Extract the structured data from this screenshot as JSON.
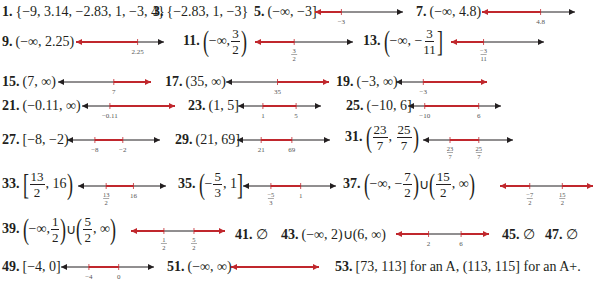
{
  "colors": {
    "solution": "#c0272d",
    "axis": "#231f20",
    "label": "#555555"
  },
  "answers": [
    {
      "number": "1.",
      "text": "{−9, 3.14, −2.83, 1, −3, 4}"
    },
    {
      "number": "3.",
      "text": "{−2.83, 1, −3}"
    },
    {
      "number": "5.",
      "text": "(−∞, −3]",
      "line": {
        "ticks": [
          "−3"
        ]
      }
    },
    {
      "number": "7.",
      "text": "(−∞, 4.8)",
      "line": {
        "ticks": [
          "4.8"
        ]
      }
    },
    {
      "number": "9.",
      "text": "(−∞, 2.25)",
      "line": {
        "ticks": [
          "2.25"
        ]
      }
    },
    {
      "number": "11.",
      "pre": "−∞,",
      "frac": [
        "3",
        "2"
      ],
      "line": {
        "ticks": [
          [
            "3",
            "2"
          ]
        ]
      }
    },
    {
      "number": "13.",
      "pre": "−∞, −",
      "frac": [
        "3",
        "11"
      ],
      "line": {
        "ticks": [
          [
            "−3",
            "11"
          ]
        ]
      }
    },
    {
      "number": "15.",
      "text": "(7, ∞)",
      "line": {
        "ticks": [
          "7"
        ]
      }
    },
    {
      "number": "17.",
      "text": "(35, ∞)",
      "line": {
        "ticks": [
          "35"
        ]
      }
    },
    {
      "number": "19.",
      "text": "(−3, ∞)",
      "line": {
        "ticks": [
          "−3"
        ]
      }
    },
    {
      "number": "21.",
      "text": "(−0.11, ∞)",
      "line": {
        "ticks": [
          "−0.11"
        ]
      }
    },
    {
      "number": "23.",
      "text": "(1, 5]",
      "line": {
        "ticks": [
          "1",
          "5"
        ]
      }
    },
    {
      "number": "25.",
      "text": "(−10, 6]",
      "line": {
        "ticks": [
          "−10",
          "6"
        ]
      }
    },
    {
      "number": "27.",
      "text": "[−8, −2)",
      "line": {
        "ticks": [
          "−8",
          "−2"
        ]
      }
    },
    {
      "number": "29.",
      "text": "(21, 69]",
      "line": {
        "ticks": [
          "21",
          "69"
        ]
      }
    },
    {
      "number": "31.",
      "frac1": [
        "23",
        "7"
      ],
      "frac2": [
        "25",
        "7"
      ],
      "line": {
        "ticks": [
          [
            "23",
            "7"
          ],
          [
            "25",
            "7"
          ]
        ]
      }
    },
    {
      "number": "33.",
      "frac1": [
        "13",
        "2"
      ],
      "post": "16",
      "line": {
        "ticks": [
          [
            "13",
            "2"
          ],
          "16"
        ]
      }
    },
    {
      "number": "35.",
      "pre": "−",
      "frac1": [
        "5",
        "3"
      ],
      "post": "1",
      "line": {
        "ticks": [
          [
            "−5",
            "3"
          ],
          "1"
        ]
      }
    },
    {
      "number": "37.",
      "pre": "−∞, −",
      "frac1": [
        "7",
        "2"
      ],
      "union": "∪",
      "frac2": [
        "15",
        "2"
      ],
      "post": "∞",
      "line": {
        "ticks": [
          [
            "−7",
            "2"
          ],
          [
            "15",
            "2"
          ]
        ]
      }
    },
    {
      "number": "39.",
      "pre": "−∞,",
      "frac1": [
        "1",
        "2"
      ],
      "union": "∪",
      "frac2": [
        "5",
        "2"
      ],
      "post": "∞",
      "line": {
        "ticks": [
          [
            "1",
            "2"
          ],
          [
            "5",
            "2"
          ]
        ]
      }
    },
    {
      "number": "41.",
      "text": "∅"
    },
    {
      "number": "43.",
      "text": "(−∞, 2)∪(6, ∞)",
      "line": {
        "ticks": [
          "2",
          "6"
        ]
      }
    },
    {
      "number": "45.",
      "text": "∅"
    },
    {
      "number": "47.",
      "text": "∅"
    },
    {
      "number": "49.",
      "text": "[−4, 0]",
      "line": {
        "ticks": [
          "−4",
          "0"
        ]
      }
    },
    {
      "number": "51.",
      "text": "(−∞, ∞)",
      "line": {
        "ticks": []
      }
    },
    {
      "number": "53.",
      "text": "[73, 113] for an A, (113, 115] for an A+."
    }
  ]
}
